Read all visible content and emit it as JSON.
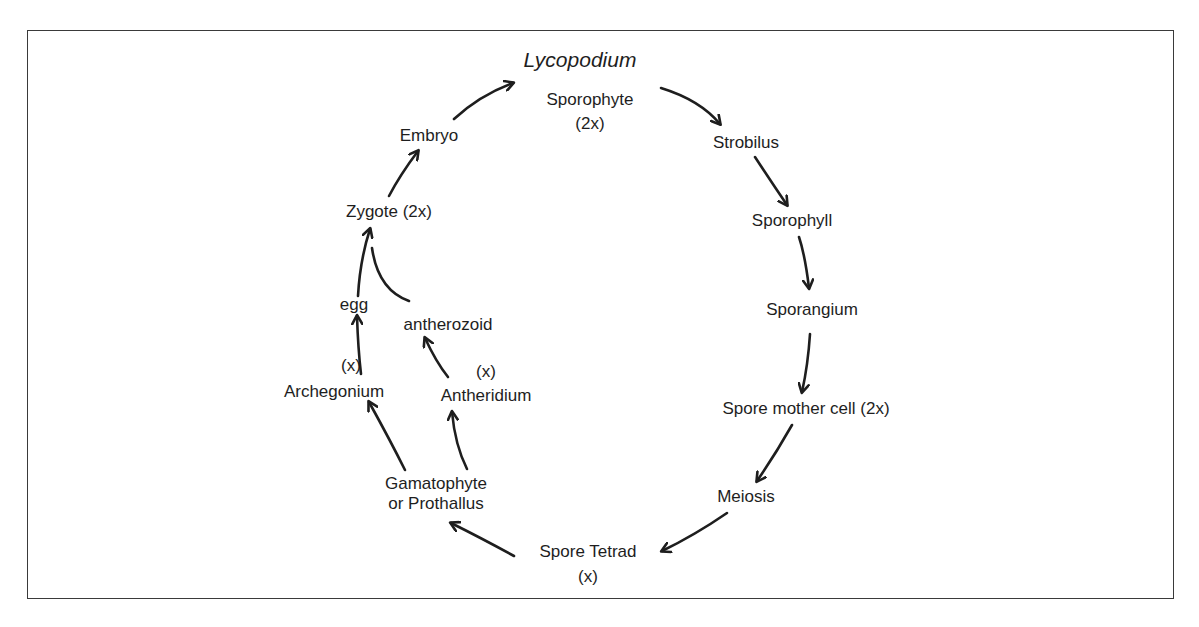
{
  "title": "Lycopodium",
  "nodes": {
    "sporophyte": {
      "label": "Sporophyte",
      "ploidy": "(2x)"
    },
    "strobilus": {
      "label": "Strobilus"
    },
    "sporophyll": {
      "label": "Sporophyll"
    },
    "sporangium": {
      "label": "Sporangium"
    },
    "spore_mother_cell": {
      "label": "Spore mother cell (2x)"
    },
    "meiosis": {
      "label": "Meiosis"
    },
    "spore_tetrad": {
      "label": "Spore Tetrad",
      "ploidy": "(x)"
    },
    "gametophyte": {
      "label": "Gamatophyte",
      "label2": "or Prothallus"
    },
    "archegonium": {
      "label": "Archegonium",
      "ploidy": "(x)"
    },
    "antheridium": {
      "label": "Antheridium",
      "ploidy": "(x)"
    },
    "egg": {
      "label": "egg"
    },
    "antherozoid": {
      "label": "antherozoid"
    },
    "zygote": {
      "label": "Zygote  (2x)"
    },
    "embryo": {
      "label": "Embryo"
    }
  },
  "edges": [
    [
      "sporophyte",
      "strobilus"
    ],
    [
      "strobilus",
      "sporophyll"
    ],
    [
      "sporophyll",
      "sporangium"
    ],
    [
      "sporangium",
      "spore_mother_cell"
    ],
    [
      "spore_mother_cell",
      "meiosis"
    ],
    [
      "meiosis",
      "spore_tetrad"
    ],
    [
      "spore_tetrad",
      "gametophyte"
    ],
    [
      "gametophyte",
      "archegonium"
    ],
    [
      "gametophyte",
      "antheridium"
    ],
    [
      "archegonium",
      "egg"
    ],
    [
      "antheridium",
      "antherozoid"
    ],
    [
      "egg",
      "zygote"
    ],
    [
      "antherozoid",
      "zygote"
    ],
    [
      "zygote",
      "embryo"
    ],
    [
      "embryo",
      "sporophyte"
    ]
  ],
  "colors": {
    "ink": "#1e1e1e",
    "frame": "#3a3a3a",
    "background": "#ffffff"
  }
}
